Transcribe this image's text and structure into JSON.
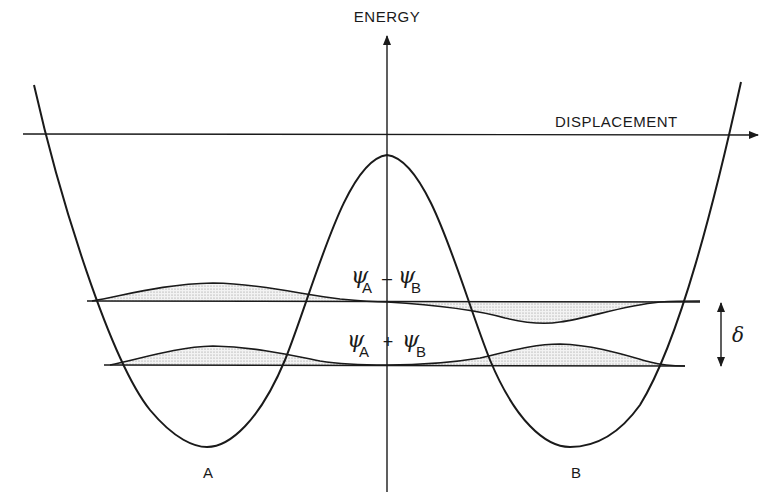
{
  "figure": {
    "type": "double-well potential energy diagram",
    "axes": {
      "vertical_label": "ENERGY",
      "horizontal_label": "DISPLACEMENT"
    },
    "wells": [
      {
        "label": "A"
      },
      {
        "label": "B"
      }
    ],
    "levels": [
      {
        "name": "antisymmetric",
        "psi": "ψ",
        "sub_left": "A",
        "operator": "–",
        "sub_right": "B"
      },
      {
        "name": "symmetric",
        "psi": "ψ",
        "sub_left": "A",
        "operator": "+",
        "sub_right": "B"
      }
    ],
    "splitting_label": "δ",
    "colors": {
      "ink": "#1a1a1a",
      "shading": "#bdbdbd",
      "background": "#ffffff"
    }
  }
}
